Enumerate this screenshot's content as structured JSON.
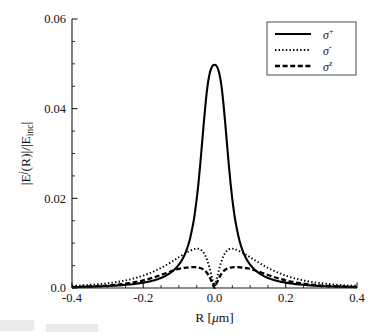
{
  "figure": {
    "background_color": "#ffffff",
    "ink_color": "#000000"
  },
  "chart_data": {
    "type": "line",
    "title": "",
    "subtitle": "",
    "xlabel": "R [μm]",
    "ylabel": "|Eʲ(R)|/|Eᵢₙ₄|",
    "ylabel_parts": {
      "base_open": "|E",
      "superscript": "j",
      "mid": "(R)|/|E",
      "subscript": "inc",
      "close": "|"
    },
    "xlabel_parts": {
      "symbol": "R",
      "unit_open": "[",
      "unit_mu": "μ",
      "unit_m": "m",
      "unit_close": "]"
    },
    "xlim": [
      -0.4,
      0.4
    ],
    "ylim": [
      0.0,
      0.06
    ],
    "xticks": [
      -0.4,
      -0.2,
      0.0,
      0.2,
      0.4
    ],
    "xticklabels": [
      "-0.4",
      "-0.2",
      "0.0",
      "0.2",
      "0.4"
    ],
    "yticks": [
      0.0,
      0.02,
      0.04,
      0.06
    ],
    "yticklabels": [
      "0.0",
      "0.02",
      "0.04",
      "0.06"
    ],
    "x_minor_step": 0.05,
    "y_minor_step": 0.005,
    "grid": false,
    "legend_position": "top-right",
    "legend_entries": [
      {
        "label": "σ",
        "superscript": "+",
        "style": "solid",
        "name": "sigma-plus"
      },
      {
        "label": "σ",
        "superscript": "-",
        "style": "dotted",
        "name": "sigma-minus"
      },
      {
        "label": "σ",
        "superscript": "z",
        "style": "dashed",
        "name": "sigma-z"
      }
    ],
    "x": [
      -0.4,
      -0.38,
      -0.36,
      -0.34,
      -0.32,
      -0.3,
      -0.28,
      -0.26,
      -0.24,
      -0.22,
      -0.2,
      -0.18,
      -0.16,
      -0.14,
      -0.12,
      -0.11,
      -0.1,
      -0.09,
      -0.08,
      -0.07,
      -0.06,
      -0.055,
      -0.05,
      -0.045,
      -0.04,
      -0.035,
      -0.03,
      -0.025,
      -0.02,
      -0.015,
      -0.01,
      -0.005,
      0.0,
      0.005,
      0.01,
      0.015,
      0.02,
      0.025,
      0.03,
      0.035,
      0.04,
      0.045,
      0.05,
      0.055,
      0.06,
      0.07,
      0.08,
      0.09,
      0.1,
      0.11,
      0.12,
      0.14,
      0.16,
      0.18,
      0.2,
      0.22,
      0.24,
      0.26,
      0.28,
      0.3,
      0.32,
      0.34,
      0.36,
      0.38,
      0.4
    ],
    "series": [
      {
        "name": "sigma-plus",
        "label": "σ+",
        "style": "solid",
        "stroke_width": 2.1,
        "values": [
          0.0002,
          0.00023,
          0.00027,
          0.00031,
          0.00037,
          0.00044,
          0.00053,
          0.00064,
          0.00078,
          0.00096,
          0.0012,
          0.00152,
          0.00196,
          0.0026,
          0.0036,
          0.0043,
          0.0052,
          0.0064,
          0.0081,
          0.0106,
          0.0143,
          0.0168,
          0.0198,
          0.0234,
          0.0276,
          0.0322,
          0.0369,
          0.0412,
          0.0448,
          0.0473,
          0.0488,
          0.0496,
          0.0498,
          0.0496,
          0.0488,
          0.0473,
          0.0448,
          0.0412,
          0.0369,
          0.0322,
          0.0276,
          0.0234,
          0.0198,
          0.0168,
          0.0143,
          0.0106,
          0.0081,
          0.0064,
          0.0052,
          0.0043,
          0.0036,
          0.0026,
          0.00196,
          0.00152,
          0.0012,
          0.00096,
          0.00078,
          0.00064,
          0.00053,
          0.00044,
          0.00037,
          0.00031,
          0.00027,
          0.00023,
          0.0002
        ]
      },
      {
        "name": "sigma-minus",
        "label": "σ-",
        "style": "dotted",
        "stroke_width": 1.9,
        "values": [
          0.00048,
          0.00055,
          0.00064,
          0.00075,
          0.00089,
          0.00106,
          0.00127,
          0.00153,
          0.00186,
          0.00226,
          0.00276,
          0.00336,
          0.00408,
          0.00492,
          0.00586,
          0.00636,
          0.00686,
          0.00735,
          0.00782,
          0.00824,
          0.00858,
          0.0087,
          0.00878,
          0.00876,
          0.00862,
          0.00832,
          0.00782,
          0.00708,
          0.00608,
          0.00478,
          0.00326,
          0.00164,
          2e-05,
          0.00164,
          0.00326,
          0.00478,
          0.00608,
          0.00708,
          0.00782,
          0.00832,
          0.00862,
          0.00876,
          0.00878,
          0.0087,
          0.00858,
          0.00824,
          0.00782,
          0.00735,
          0.00686,
          0.00636,
          0.00586,
          0.00492,
          0.00408,
          0.00336,
          0.00276,
          0.00226,
          0.00186,
          0.00153,
          0.00127,
          0.00106,
          0.00089,
          0.00075,
          0.00064,
          0.00055,
          0.00048
        ]
      },
      {
        "name": "sigma-z",
        "label": "σz",
        "style": "dashed",
        "stroke_width": 2.3,
        "values": [
          0.00022,
          0.00026,
          0.00031,
          0.00037,
          0.00045,
          0.00055,
          0.00068,
          0.00085,
          0.00107,
          0.00135,
          0.0017,
          0.00213,
          0.00264,
          0.0032,
          0.00376,
          0.00402,
          0.00424,
          0.00442,
          0.00455,
          0.00463,
          0.00466,
          0.00465,
          0.00462,
          0.00456,
          0.00446,
          0.0043,
          0.00406,
          0.00372,
          0.00324,
          0.00258,
          0.00178,
          0.0009,
          2e-05,
          0.0009,
          0.00178,
          0.00258,
          0.00324,
          0.00372,
          0.00406,
          0.0043,
          0.00446,
          0.00456,
          0.00462,
          0.00465,
          0.00466,
          0.00463,
          0.00455,
          0.00442,
          0.00424,
          0.00402,
          0.00376,
          0.0032,
          0.00264,
          0.00213,
          0.0017,
          0.00135,
          0.00107,
          0.00085,
          0.00068,
          0.00055,
          0.00045,
          0.00037,
          0.00031,
          0.00026,
          0.00022
        ]
      }
    ],
    "annotations": {
      "peak_sigma_plus": {
        "x": 0.0,
        "y": 0.0498
      },
      "sidelobe_sigma_minus": {
        "x": 0.05,
        "y": 0.0088
      },
      "sidelobe_sigma_z": {
        "x": 0.06,
        "y": 0.0047
      },
      "node": {
        "x": 0.0,
        "y": 0.0
      }
    }
  },
  "plot_geometry": {
    "left": 72,
    "top": 19,
    "right": 357,
    "bottom": 288
  }
}
